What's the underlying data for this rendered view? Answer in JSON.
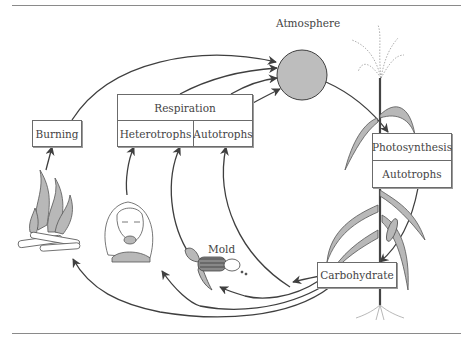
{
  "diagram": {
    "title": "Atmosphere",
    "reservoir": {
      "shape": "circle",
      "fill": "#bdbdbd"
    },
    "boxes": {
      "burning": {
        "label": "Burning"
      },
      "respiration": {
        "label": "Respiration",
        "sub": [
          "Heterotrophs",
          "Autotrophs"
        ]
      },
      "photosynthesis": {
        "label": "Photosynthesis",
        "sub": "Autotrophs"
      },
      "carbohydrate": {
        "label": "Carbohydrate"
      }
    },
    "annotations": {
      "mold": "Mold"
    },
    "illustrations": [
      "campfire",
      "person-eating",
      "moldy-corn-cob",
      "corn-plant"
    ],
    "arrows": [
      {
        "from": "Burning",
        "to": "Atmosphere"
      },
      {
        "from": "Respiration",
        "to": "Atmosphere"
      },
      {
        "from": "Atmosphere",
        "to": "Photosynthesis"
      },
      {
        "from": "Photosynthesis",
        "to": "Carbohydrate"
      },
      {
        "from": "Carbohydrate",
        "to": "Burning"
      },
      {
        "from": "Carbohydrate",
        "to": "Heterotrophs"
      },
      {
        "from": "Carbohydrate",
        "to": "Mold"
      },
      {
        "from": "Carbohydrate",
        "to": "Autotrophs"
      },
      {
        "from": "campfire",
        "to": "Burning"
      },
      {
        "from": "person-eating",
        "to": "Heterotrophs"
      },
      {
        "from": "Mold",
        "to": "Heterotrophs"
      }
    ],
    "colors": {
      "line": "#3f3f3f",
      "illustration_fill": "#b8b8b8",
      "box_border": "#6b6b6b"
    }
  }
}
